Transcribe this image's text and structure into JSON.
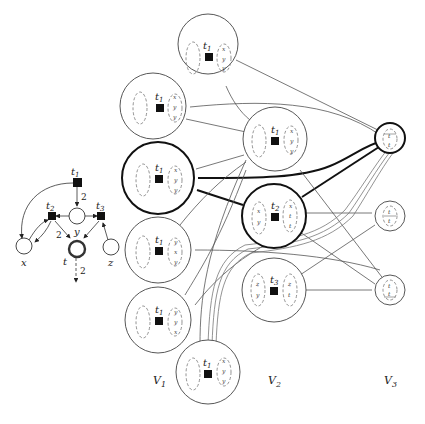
{
  "petri_net": {
    "transitions": [
      {
        "id": "t1",
        "label": "t",
        "sub": "1"
      },
      {
        "id": "t2",
        "label": "t",
        "sub": "2"
      },
      {
        "id": "t3",
        "label": "t",
        "sub": "3"
      }
    ],
    "places": [
      {
        "id": "x",
        "label": "x"
      },
      {
        "id": "y",
        "label": "y"
      },
      {
        "id": "t",
        "label": "t"
      },
      {
        "id": "z",
        "label": "z"
      }
    ],
    "arc_weights": {
      "t1_to_y": "2",
      "t2_to_t": "2",
      "t_out": "2"
    }
  },
  "graph": {
    "columns": [
      {
        "label": "V",
        "sub": "1"
      },
      {
        "label": "V",
        "sub": "2"
      },
      {
        "label": "V",
        "sub": "3"
      }
    ],
    "v1_nodes": [
      {
        "transition": "t",
        "sub": "1",
        "right": [
          "x",
          "y",
          "y"
        ]
      },
      {
        "transition": "t",
        "sub": "1",
        "right": [
          "x",
          "y",
          "y"
        ]
      },
      {
        "transition": "t",
        "sub": "1",
        "right": [
          "x",
          "y",
          "y"
        ]
      },
      {
        "transition": "t",
        "sub": "1",
        "right": [
          "y",
          "x",
          "y"
        ]
      },
      {
        "transition": "t",
        "sub": "1",
        "right": [
          "y",
          "y",
          "x"
        ]
      },
      {
        "transition": "t",
        "sub": "1",
        "right": [
          "x",
          "y",
          "y"
        ]
      }
    ],
    "v2_nodes": [
      {
        "transition": "t",
        "sub": "1",
        "left": [],
        "right": [
          "x",
          "y",
          "y"
        ]
      },
      {
        "transition": "t",
        "sub": "2",
        "left": [
          "x",
          "y"
        ],
        "right": [
          "x",
          "t",
          "t"
        ]
      },
      {
        "transition": "t",
        "sub": "3",
        "left": [
          "z",
          "y"
        ],
        "right": [
          "z",
          "t"
        ]
      }
    ],
    "v3_nodes": [
      {
        "inner": [
          "t",
          "t"
        ]
      },
      {
        "inner": [
          "t",
          "t"
        ]
      },
      {
        "inner": [
          "t",
          "t"
        ]
      }
    ]
  }
}
